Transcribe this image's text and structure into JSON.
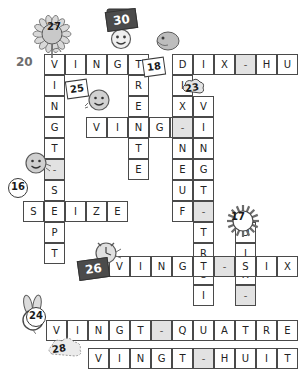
{
  "puzzle": {
    "title": "Mots croises des nombres",
    "language": "French",
    "cell_size": 21,
    "grid_origin": {
      "x": 44,
      "y": 54
    },
    "colors": {
      "cell_border": "#4a4a4a",
      "cell_fill": "#ffffff",
      "dash_fill": "#e2e2e2",
      "blank_fill": "#e8e8e8",
      "clue_dark_bg": "#4b4b4b",
      "text": "#222222"
    }
  },
  "entries": [
    {
      "number": "20",
      "answer": "VINGT-SEPT",
      "direction": "down",
      "letters": [
        "V",
        "I",
        "N",
        "G",
        "T",
        "-",
        "S",
        "E",
        "P",
        "T"
      ],
      "col": 0,
      "row": 0
    },
    {
      "number": "30",
      "answer": "TRENTE",
      "direction": "down",
      "letters": [
        "T",
        "R",
        "E",
        "N",
        "T",
        "E"
      ],
      "col": 4,
      "row": 0
    },
    {
      "number": "27",
      "answer": "VINGT",
      "direction": "across",
      "letters": [
        "V",
        "I",
        "N",
        "G",
        "T"
      ],
      "col": 0,
      "row": 0
    },
    {
      "number": "21",
      "answer": "VINGT-ET-UN",
      "direction": "down",
      "letters": [
        "V",
        "I",
        "N",
        "G",
        "T",
        "-",
        "E",
        "T",
        "-",
        "U",
        "N"
      ],
      "col": 11,
      "row": -4
    },
    {
      "number": "18",
      "answer": "DIX-HUIT",
      "direction": "across",
      "letters": [
        "D",
        "I",
        "X",
        "-",
        "H",
        "U",
        "I",
        "T"
      ],
      "col": 6,
      "row": 0
    },
    {
      "number": "19",
      "answer": "DIX-NEUF",
      "direction": "down",
      "letters": [
        "D",
        "I",
        "X",
        "-",
        "N",
        "E",
        "U",
        "F"
      ],
      "col": 6,
      "row": 0
    },
    {
      "number": "25",
      "answer": "VINGT-CINQ",
      "direction": "across",
      "letters": [
        "V",
        "I",
        "N",
        "G",
        "T",
        "-",
        "C",
        "I",
        "N",
        "Q"
      ],
      "col": 2,
      "row": 2
    },
    {
      "number": "23",
      "answer": "VINGT-TROIS",
      "direction": "down",
      "letters": [
        "V",
        "I",
        "N",
        "G",
        "T",
        "-",
        "T",
        "R",
        "O",
        "I",
        "S"
      ],
      "col": 7,
      "row": 2
    },
    {
      "number": "16",
      "answer": "SEIZE",
      "direction": "across",
      "letters": [
        "S",
        "E",
        "I",
        "Z",
        "E"
      ],
      "col": -1,
      "row": 6
    },
    {
      "number": "26",
      "answer": "VINGT-SIX",
      "direction": "across",
      "letters": [
        "V",
        "I",
        "N",
        "G",
        "T",
        "-",
        "S",
        "I",
        "X"
      ],
      "col": 3,
      "row": 9
    },
    {
      "number": "17",
      "answer": "DIX-SEPT",
      "direction": "down",
      "letters": [
        "D",
        "I",
        "X",
        "-",
        "S",
        "E",
        "P",
        "T"
      ],
      "col": 9,
      "row": 8
    },
    {
      "number": "24",
      "answer": "VINGT-QUATRE",
      "direction": "across",
      "letters": [
        "V",
        "I",
        "N",
        "G",
        "T",
        "-",
        "Q",
        "U",
        "A",
        "T",
        "R",
        "E"
      ],
      "col": 0,
      "row": 12
    },
    {
      "number": "28",
      "answer": "VINGT-HUIT",
      "direction": "across",
      "letters": [
        "V",
        "I",
        "N",
        "G",
        "T",
        "-",
        "H",
        "U",
        "I",
        "T"
      ],
      "col": 2,
      "row": 14
    }
  ],
  "cells": [
    {
      "x": 44,
      "y": 54,
      "ch": "V"
    },
    {
      "x": 65,
      "y": 54,
      "ch": "I"
    },
    {
      "x": 86,
      "y": 54,
      "ch": "N"
    },
    {
      "x": 107,
      "y": 54,
      "ch": "G"
    },
    {
      "x": 128,
      "y": 54,
      "ch": "T"
    },
    {
      "x": 172,
      "y": 54,
      "ch": "D"
    },
    {
      "x": 193,
      "y": 54,
      "ch": "I"
    },
    {
      "x": 214,
      "y": 54,
      "ch": "X"
    },
    {
      "x": 235,
      "y": 54,
      "ch": "-"
    },
    {
      "x": 256,
      "y": 54,
      "ch": "H"
    },
    {
      "x": 277,
      "y": 54,
      "ch": "U"
    },
    {
      "x": 44,
      "y": 75,
      "ch": "I"
    },
    {
      "x": 128,
      "y": 75,
      "ch": "R"
    },
    {
      "x": 172,
      "y": 75,
      "ch": "I"
    },
    {
      "x": 44,
      "y": 96,
      "ch": "N"
    },
    {
      "x": 128,
      "y": 96,
      "ch": "E"
    },
    {
      "x": 172,
      "y": 96,
      "ch": "X"
    },
    {
      "x": 193,
      "y": 96,
      "ch": "V"
    },
    {
      "x": 44,
      "y": 117,
      "ch": "G"
    },
    {
      "x": 86,
      "y": 117,
      "ch": "V"
    },
    {
      "x": 107,
      "y": 117,
      "ch": "I"
    },
    {
      "x": 128,
      "y": 117,
      "ch": "N"
    },
    {
      "x": 149,
      "y": 117,
      "ch": "G"
    },
    {
      "x": 170,
      "y": 117,
      "ch": "T"
    },
    {
      "x": 172,
      "y": 117,
      "ch": "-"
    },
    {
      "x": 193,
      "y": 117,
      "ch": "I"
    },
    {
      "x": 44,
      "y": 138,
      "ch": "T"
    },
    {
      "x": 128,
      "y": 138,
      "ch": "T"
    },
    {
      "x": 172,
      "y": 138,
      "ch": "N"
    },
    {
      "x": 193,
      "y": 138,
      "ch": "N"
    },
    {
      "x": 44,
      "y": 159,
      "ch": "-"
    },
    {
      "x": 128,
      "y": 159,
      "ch": "E"
    },
    {
      "x": 172,
      "y": 159,
      "ch": "E"
    },
    {
      "x": 193,
      "y": 159,
      "ch": "G"
    },
    {
      "x": 44,
      "y": 180,
      "ch": "S"
    },
    {
      "x": 172,
      "y": 180,
      "ch": "U"
    },
    {
      "x": 193,
      "y": 180,
      "ch": "T"
    },
    {
      "x": 23,
      "y": 201,
      "ch": "S"
    },
    {
      "x": 44,
      "y": 201,
      "ch": "E"
    },
    {
      "x": 65,
      "y": 201,
      "ch": "I"
    },
    {
      "x": 86,
      "y": 201,
      "ch": "Z"
    },
    {
      "x": 107,
      "y": 201,
      "ch": "E"
    },
    {
      "x": 172,
      "y": 201,
      "ch": "F"
    },
    {
      "x": 193,
      "y": 201,
      "ch": "-"
    },
    {
      "x": 44,
      "y": 222,
      "ch": "P"
    },
    {
      "x": 193,
      "y": 222,
      "ch": "T"
    },
    {
      "x": 235,
      "y": 222,
      "ch": "D"
    },
    {
      "x": 44,
      "y": 243,
      "ch": "T"
    },
    {
      "x": 193,
      "y": 243,
      "ch": "R"
    },
    {
      "x": 235,
      "y": 243,
      "ch": "I"
    },
    {
      "x": 193,
      "y": 264,
      "ch": "O"
    },
    {
      "x": 235,
      "y": 264,
      "ch": "X"
    },
    {
      "x": 193,
      "y": 285,
      "ch": "I"
    },
    {
      "x": 235,
      "y": 285,
      "ch": "-"
    },
    {
      "x": 109,
      "y": 256,
      "ch": "V"
    },
    {
      "x": 130,
      "y": 256,
      "ch": "I"
    },
    {
      "x": 151,
      "y": 256,
      "ch": "N"
    },
    {
      "x": 172,
      "y": 256,
      "ch": "G"
    },
    {
      "x": 193,
      "y": 256,
      "ch": "T"
    },
    {
      "x": 214,
      "y": 256,
      "ch": "-"
    },
    {
      "x": 235,
      "y": 256,
      "ch": "S"
    },
    {
      "x": 256,
      "y": 256,
      "ch": "I"
    },
    {
      "x": 277,
      "y": 256,
      "ch": "X"
    },
    {
      "x": 46,
      "y": 320,
      "ch": "V"
    },
    {
      "x": 67,
      "y": 320,
      "ch": "I"
    },
    {
      "x": 88,
      "y": 320,
      "ch": "N"
    },
    {
      "x": 109,
      "y": 320,
      "ch": "G"
    },
    {
      "x": 130,
      "y": 320,
      "ch": "T"
    },
    {
      "x": 151,
      "y": 320,
      "ch": "-"
    },
    {
      "x": 172,
      "y": 320,
      "ch": "Q"
    },
    {
      "x": 193,
      "y": 320,
      "ch": "U"
    },
    {
      "x": 214,
      "y": 320,
      "ch": "A"
    },
    {
      "x": 235,
      "y": 320,
      "ch": "T"
    },
    {
      "x": 256,
      "y": 320,
      "ch": "R"
    },
    {
      "x": 277,
      "y": 320,
      "ch": "E"
    },
    {
      "x": 88,
      "y": 348,
      "ch": "V"
    },
    {
      "x": 109,
      "y": 348,
      "ch": "I"
    },
    {
      "x": 130,
      "y": 348,
      "ch": "N"
    },
    {
      "x": 151,
      "y": 348,
      "ch": "G"
    },
    {
      "x": 172,
      "y": 348,
      "ch": "T"
    },
    {
      "x": 193,
      "y": 348,
      "ch": "-"
    },
    {
      "x": 214,
      "y": 348,
      "ch": "H"
    },
    {
      "x": 235,
      "y": 348,
      "ch": "U"
    },
    {
      "x": 256,
      "y": 348,
      "ch": "I"
    },
    {
      "x": 277,
      "y": 348,
      "ch": "T"
    }
  ],
  "clue_markers": [
    {
      "id": "clue-20",
      "label": "20",
      "style": "plain",
      "x": 16,
      "y": 55
    },
    {
      "id": "clue-27",
      "label": "27",
      "style": "sun",
      "x": 45,
      "y": 18
    },
    {
      "id": "clue-30",
      "label": "30",
      "style": "dark",
      "x": 106,
      "y": 10
    },
    {
      "id": "clue-18",
      "label": "18",
      "style": "box",
      "x": 143,
      "y": 58
    },
    {
      "id": "clue-25",
      "label": "25",
      "style": "box",
      "x": 66,
      "y": 80
    },
    {
      "id": "clue-23",
      "label": "23",
      "style": "cloud",
      "x": 183,
      "y": 79
    },
    {
      "id": "clue-16",
      "label": "16",
      "style": "circle",
      "x": 8,
      "y": 178
    },
    {
      "id": "clue-26",
      "label": "26",
      "style": "dark",
      "x": 78,
      "y": 259
    },
    {
      "id": "clue-17",
      "label": "17",
      "style": "sun",
      "x": 229,
      "y": 208
    },
    {
      "id": "clue-24",
      "label": "24",
      "style": "circle",
      "x": 26,
      "y": 307
    },
    {
      "id": "clue-28",
      "label": "28",
      "style": "cloud",
      "x": 50,
      "y": 340
    }
  ],
  "decorations": [
    {
      "id": "sunflower-27",
      "name": "sunflower-icon",
      "x": 32,
      "y": 14
    },
    {
      "id": "sign-30",
      "name": "signpost-figure-icon",
      "x": 104,
      "y": 8
    },
    {
      "id": "bird-18",
      "name": "bird-icon",
      "x": 155,
      "y": 30
    },
    {
      "id": "ball-25",
      "name": "smiley-ball-icon",
      "x": 86,
      "y": 89
    },
    {
      "id": "cloud-23",
      "name": "cloud-icon",
      "x": 182,
      "y": 78
    },
    {
      "id": "smiley-16",
      "name": "smiley-face-icon",
      "x": 24,
      "y": 152
    },
    {
      "id": "clock-26",
      "name": "alarm-clock-icon",
      "x": 92,
      "y": 240
    },
    {
      "id": "sun-17",
      "name": "sun-burst-icon",
      "x": 228,
      "y": 206
    },
    {
      "id": "bunny-24",
      "name": "bunny-ears-icon",
      "x": 18,
      "y": 296
    },
    {
      "id": "cloud-28",
      "name": "cloud-puff-icon",
      "x": 48,
      "y": 338
    }
  ]
}
